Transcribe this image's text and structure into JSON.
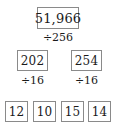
{
  "diagram": {
    "type": "factor-tree",
    "background_color": "#ffffff",
    "box_border_color": "#8a8a8a",
    "text_color": "#1b1b1b",
    "levels": [
      {
        "level": 0,
        "nodes": [
          {
            "value": "51,966"
          }
        ],
        "operator_below": [
          {
            "label": "÷256"
          }
        ]
      },
      {
        "level": 1,
        "nodes": [
          {
            "value": "202"
          },
          {
            "value": "254"
          }
        ],
        "operator_below": [
          {
            "label": "÷16"
          },
          {
            "label": "÷16"
          }
        ]
      },
      {
        "level": 2,
        "nodes": [
          {
            "value": "12"
          },
          {
            "value": "10"
          },
          {
            "value": "15"
          },
          {
            "value": "14"
          }
        ],
        "operator_below": []
      }
    ]
  }
}
